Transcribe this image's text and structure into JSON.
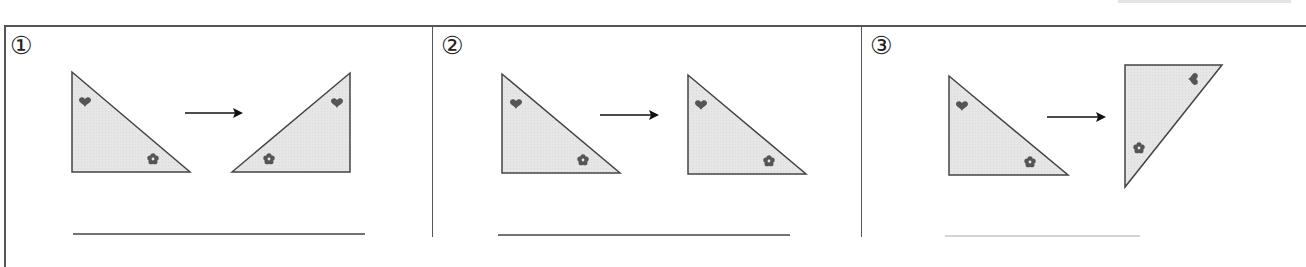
{
  "worksheet": {
    "panels": [
      {
        "label": "①",
        "description": "right triangle flipped horizontally (reflection)",
        "answer_line": ""
      },
      {
        "label": "②",
        "description": "right triangle slid (translation)",
        "answer_line": ""
      },
      {
        "label": "③",
        "description": "right triangle rotated",
        "answer_line": ""
      }
    ],
    "symbols": {
      "top": "heart-icon",
      "bottom": "flower-icon",
      "arrow": "right-arrow-icon"
    },
    "colors": {
      "fill": "#e8e8e8",
      "stroke": "#444444",
      "symbol": "#555555",
      "border": "#555555"
    }
  }
}
